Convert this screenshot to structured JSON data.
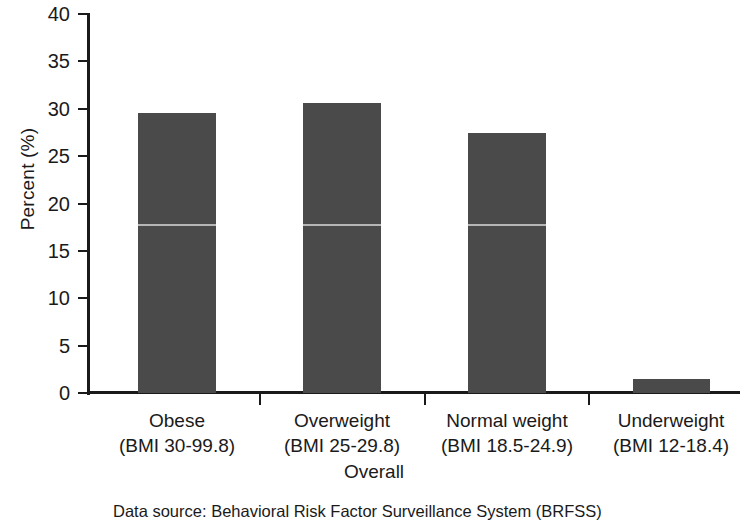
{
  "chart_data": {
    "type": "bar",
    "title": "",
    "xlabel": "Overall",
    "ylabel": "Percent (%)",
    "ylim": [
      0,
      40
    ],
    "yticks": [
      0,
      5,
      10,
      15,
      20,
      25,
      30,
      35,
      40
    ],
    "ytick_labels": [
      "0",
      "5",
      "10",
      "15",
      "20",
      "25",
      "30",
      "35",
      "40"
    ],
    "grid": false,
    "legend": null,
    "bar_color": "#4a4a4a",
    "categories": [
      "Obese (BMI 30-99.8)",
      "Overweight (BMI 25-29.8)",
      "Normal weight (BMI 18.5-24.9)",
      "Underweight (BMI 12-18.4)"
    ],
    "category_lines": [
      {
        "line1": "Obese",
        "line2": "(BMI 30-99.8)"
      },
      {
        "line1": "Overweight",
        "line2": "(BMI 25-29.8)"
      },
      {
        "line1": "Normal weight",
        "line2": "(BMI 18.5-24.9)"
      },
      {
        "line1": "Underweight",
        "line2": "(BMI 12-18.4)"
      }
    ],
    "values": [
      29.5,
      30.6,
      27.4,
      1.5
    ],
    "annotations": [
      {
        "type": "scan-line",
        "value": 17.8
      }
    ],
    "source_note": "Data source: Behavioral Risk Factor Surveillance System (BRFSS)"
  }
}
